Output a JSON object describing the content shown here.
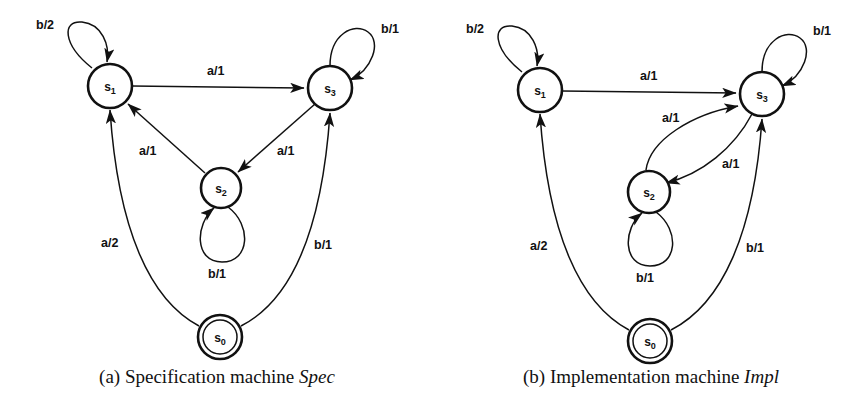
{
  "figure": {
    "panels": [
      {
        "id": "a",
        "caption_prefix": "(a) Specification machine ",
        "caption_emphasis": "Spec",
        "states": [
          {
            "id": "s1",
            "label": "s",
            "sub": "1",
            "accepting": false
          },
          {
            "id": "s2",
            "label": "s",
            "sub": "2",
            "accepting": false
          },
          {
            "id": "s3",
            "label": "s",
            "sub": "3",
            "accepting": false
          },
          {
            "id": "s0",
            "label": "s",
            "sub": "0",
            "accepting": true
          }
        ],
        "transitions": [
          {
            "from": "s1",
            "to": "s1",
            "label": "b/2",
            "kind": "self-loop"
          },
          {
            "from": "s3",
            "to": "s3",
            "label": "b/1",
            "kind": "self-loop"
          },
          {
            "from": "s2",
            "to": "s2",
            "label": "b/1",
            "kind": "self-loop"
          },
          {
            "from": "s1",
            "to": "s3",
            "label": "a/1",
            "kind": "straight"
          },
          {
            "from": "s2",
            "to": "s1",
            "label": "a/1",
            "kind": "straight"
          },
          {
            "from": "s3",
            "to": "s2",
            "label": "a/1",
            "kind": "straight"
          },
          {
            "from": "s0",
            "to": "s1",
            "label": "a/2",
            "kind": "curve"
          },
          {
            "from": "s0",
            "to": "s3",
            "label": "b/1",
            "kind": "curve"
          }
        ]
      },
      {
        "id": "b",
        "caption_prefix": "(b) Implementation machine ",
        "caption_emphasis": "Impl",
        "states": [
          {
            "id": "s1",
            "label": "s",
            "sub": "1",
            "accepting": false
          },
          {
            "id": "s2",
            "label": "s",
            "sub": "2",
            "accepting": false
          },
          {
            "id": "s3",
            "label": "s",
            "sub": "3",
            "accepting": false
          },
          {
            "id": "s0",
            "label": "s",
            "sub": "0",
            "accepting": true
          }
        ],
        "transitions": [
          {
            "from": "s1",
            "to": "s1",
            "label": "b/2",
            "kind": "self-loop"
          },
          {
            "from": "s3",
            "to": "s3",
            "label": "b/1",
            "kind": "self-loop"
          },
          {
            "from": "s2",
            "to": "s2",
            "label": "b/1",
            "kind": "self-loop"
          },
          {
            "from": "s1",
            "to": "s3",
            "label": "a/1",
            "kind": "straight"
          },
          {
            "from": "s2",
            "to": "s3",
            "label": "a/1",
            "kind": "curve"
          },
          {
            "from": "s3",
            "to": "s2",
            "label": "a/1",
            "kind": "curve"
          },
          {
            "from": "s0",
            "to": "s1",
            "label": "a/2",
            "kind": "curve"
          },
          {
            "from": "s0",
            "to": "s3",
            "label": "b/1",
            "kind": "curve"
          }
        ]
      }
    ],
    "colors": {
      "ink": "#111111",
      "paper": "#ffffff"
    },
    "labels": {
      "a": {
        "s1_node": "s1",
        "s2_node": "s2",
        "s3_node": "s3",
        "s0_node": "s0",
        "loop_s1": "b/2",
        "loop_s3": "b/1",
        "loop_s2": "b/1",
        "s1_to_s3": "a/1",
        "s2_to_s1": "a/1",
        "s3_to_s2": "a/1",
        "s0_to_s1": "a/2",
        "s0_to_s3": "b/1"
      },
      "b": {
        "loop_s1": "b/2",
        "loop_s3": "b/1",
        "loop_s2": "b/1",
        "s1_to_s3": "a/1",
        "s2_to_s3": "a/1",
        "s3_to_s2": "a/1",
        "s0_to_s1": "a/2",
        "s0_to_s3": "b/1"
      }
    }
  }
}
